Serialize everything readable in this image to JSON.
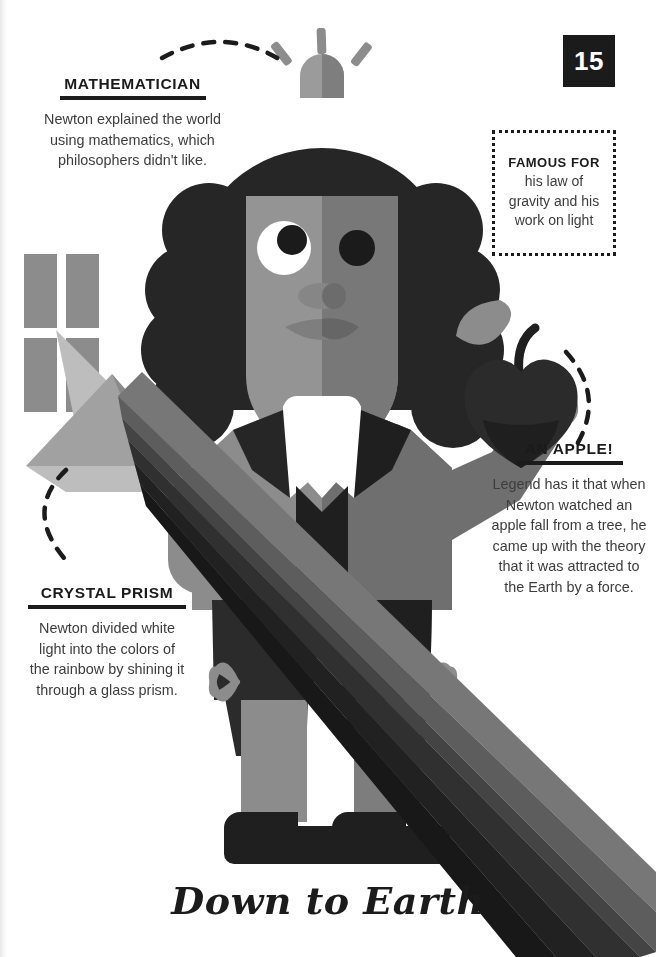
{
  "page": {
    "number": "15",
    "title": "Down to Earth",
    "background": "#ffffff"
  },
  "callouts": {
    "mathematician": {
      "heading": "MATHEMATICIAN",
      "body": "Newton explained the world\nusing mathematics, which\nphilosophers didn't like."
    },
    "crystal_prism": {
      "heading": "CRYSTAL PRISM",
      "body": "Newton divided white\nlight into the colors of\nthe rainbow by shining it\nthrough a glass prism."
    },
    "an_apple": {
      "heading": "AN APPLE!",
      "body": "Legend has it that when\nNewton watched an\napple fall from a tree, he\ncame up with the theory\nthat it was attracted to\nthe Earth by a force."
    }
  },
  "famous_for": {
    "title": "FAMOUS FOR",
    "text": "his law of\ngravity and his\nwork on light"
  },
  "illustration": {
    "subject": "isaac-newton-figure",
    "elements": [
      "idea-bulb-icon",
      "wig",
      "face",
      "cravat-collar",
      "coat",
      "waistcoat",
      "apple",
      "window-icon",
      "prism",
      "rainbow-beam",
      "knee-bows",
      "buckled-shoes"
    ],
    "colors": {
      "ink": "#1b1b1b",
      "dark": "#2b2b2b",
      "coat_light": "#8c8c8c",
      "coat_shade": "#6f6f6f",
      "skin_light": "#949494",
      "skin_shade": "#767676",
      "white": "#ffffff",
      "beam_light": "#b5b5b5",
      "spectrum": [
        "#9c9c9c",
        "#848484",
        "#6a6a6a",
        "#525252",
        "#3e3e3e",
        "#2f2f2f"
      ]
    }
  }
}
